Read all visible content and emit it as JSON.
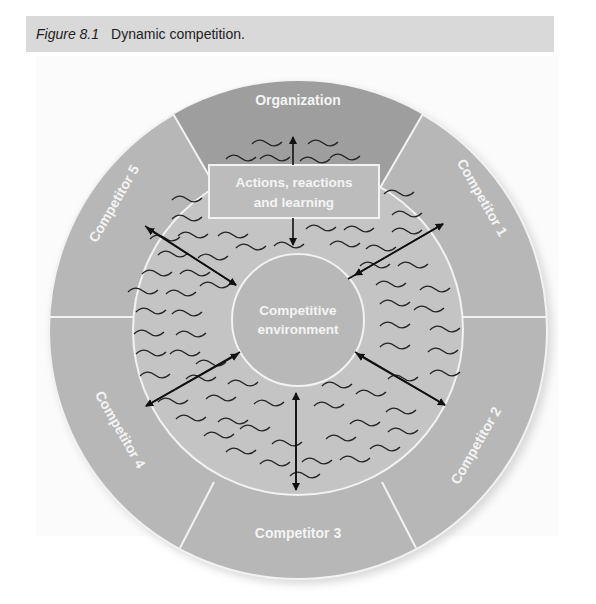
{
  "caption": {
    "figure_label": "Figure 8.1",
    "title": "Dynamic competition."
  },
  "diagram": {
    "outer_segments": [
      {
        "id": "organization",
        "label": "Organization"
      },
      {
        "id": "competitor-1",
        "label": "Competitor 1"
      },
      {
        "id": "competitor-2",
        "label": "Competitor 2"
      },
      {
        "id": "competitor-3",
        "label": "Competitor 3"
      },
      {
        "id": "competitor-4",
        "label": "Competitor 4"
      },
      {
        "id": "competitor-5",
        "label": "Competitor 5"
      }
    ],
    "middle_box": {
      "line1": "Actions, reactions",
      "line2": "and learning"
    },
    "center": {
      "line1": "Competitive",
      "line2": "environment"
    },
    "colors": {
      "organization_fill": "#9e9e9e",
      "competitor_fill": "#b7b7b7",
      "inner_ring_fill": "#c4c4c4",
      "center_fill": "#b8b8b8",
      "lines": "#f2f2f2",
      "arrows": "#111111",
      "caption_bar": "#d9d9d9"
    }
  }
}
